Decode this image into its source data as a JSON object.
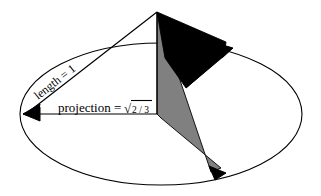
{
  "figure": {
    "name": "cone-projection-diagram",
    "background_color": "#ffffff",
    "stroke_color": "#000000",
    "shaded_faces": {
      "black_face_color": "#000000",
      "gray_face_color": "#808080"
    },
    "labels": {
      "length": {
        "text": "length = 1",
        "rotation_degrees": -38
      },
      "projection": {
        "prefix": "projection = ",
        "radical_symbol": "√",
        "radicand": "2 / 3"
      }
    },
    "geometry": {
      "apex": {
        "x": 157,
        "y": 12
      },
      "base_center": {
        "x": 157,
        "y": 114
      },
      "ellipse": {
        "cx": 161,
        "cy": 114,
        "rx": 141,
        "ry": 71
      },
      "left_arrow_tip": {
        "x": 23,
        "y": 114
      },
      "right_arrow_tip": {
        "x": 233,
        "y": 48
      },
      "bottom_arrow_tip": {
        "x": 226,
        "y": 173
      }
    }
  }
}
